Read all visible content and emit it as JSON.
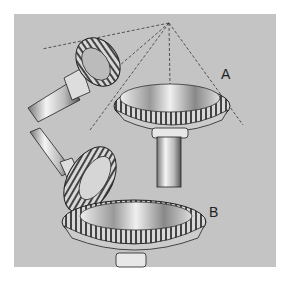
{
  "figure": {
    "labels": {
      "a": "A",
      "b": "B"
    },
    "colors": {
      "background": "#ffffff",
      "panel": "#c4c4c4",
      "ink": "#222222",
      "metal_light": "#eeeeee",
      "metal_mid": "#aaaaaa",
      "metal_dark": "#555555"
    },
    "construction_lines": {
      "style": "dashed",
      "apex": [
        169,
        23
      ]
    }
  }
}
